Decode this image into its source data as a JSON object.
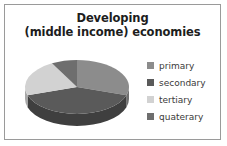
{
  "frame": {
    "border_color": "#9a9a9a",
    "background": "#ffffff"
  },
  "title": {
    "line1": "Developing",
    "line2": "(middle income) economies",
    "color": "#1d1d1d"
  },
  "legend": {
    "position": "right",
    "items": [
      {
        "label": "primary",
        "color": "#8c8c8c"
      },
      {
        "label": "secondary",
        "color": "#5a5a5a"
      },
      {
        "label": "tertiary",
        "color": "#d2d2d2"
      },
      {
        "label": "quaterary",
        "color": "#6e6e6e"
      }
    ]
  },
  "chart_data": {
    "type": "pie",
    "title": "Developing (middle income) economies",
    "xlabel": "",
    "ylabel": "",
    "three_d": true,
    "legend_position": "right",
    "grid": false,
    "categories": [
      "primary",
      "secondary",
      "tertiary",
      "quaterary"
    ],
    "values": [
      30,
      40,
      22,
      8
    ],
    "colors": [
      "#8c8c8c",
      "#5a5a5a",
      "#d2d2d2",
      "#6e6e6e"
    ],
    "side_colors": [
      "#6f6f6f",
      "#3f3f3f",
      "#a8a8a8",
      "#545454"
    ],
    "start_angle_deg": 0,
    "direction": "clockwise",
    "geometry": {
      "cx": 62,
      "cy": 42,
      "rx": 52,
      "ry": 27,
      "depth": 12
    }
  }
}
